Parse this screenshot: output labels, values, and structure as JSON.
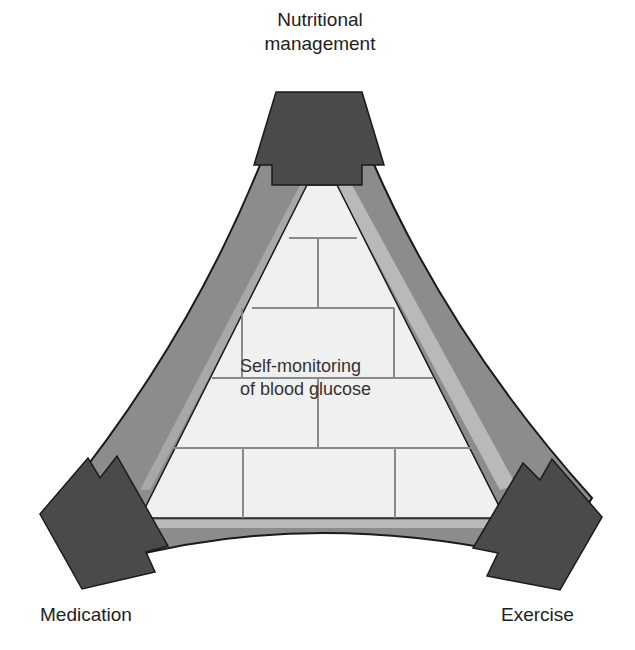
{
  "diagram": {
    "type": "triangle-framework",
    "center": {
      "line1": "Self-monitoring",
      "line2": "of blood glucose"
    },
    "corners": [
      {
        "id": "top",
        "line1": "Nutritional",
        "line2": "management"
      },
      {
        "id": "bottom-left",
        "label": "Medication"
      },
      {
        "id": "bottom-right",
        "label": "Exercise"
      }
    ],
    "colors": {
      "corner_block": "#4a4a4a",
      "band": "#8c8c8c",
      "band_highlight": "#b9b9b9",
      "inner_fill": "#f0f0f0",
      "brick_line": "#8a8a8a",
      "outline": "#1a1a1a"
    }
  }
}
